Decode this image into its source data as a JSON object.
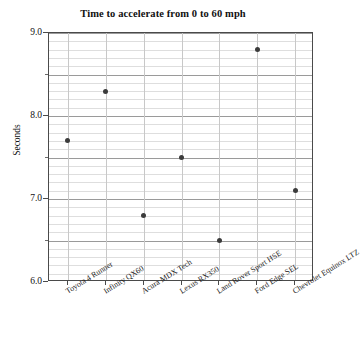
{
  "chart_data": {
    "type": "scatter",
    "title": "Time to accelerate from 0 to 60 mph",
    "xlabel": "",
    "ylabel": "Seconds",
    "categories": [
      "Toyota 4 Runner",
      "Infinity QX60",
      "Acura MDX Tech",
      "Lexus RX350",
      "Land Rover Sport HSE",
      "Ford Edge SEL",
      "Chevrolet Equinox LTZ"
    ],
    "values": [
      7.7,
      8.3,
      6.8,
      7.5,
      6.5,
      8.8,
      7.1
    ],
    "ylim": [
      6.0,
      9.0
    ],
    "y_major_ticks": [
      "9.0",
      "8.0",
      "7.0",
      "6.0"
    ],
    "y_major_values": [
      9.0,
      8.0,
      7.0,
      6.0
    ],
    "y_minor_step": 0.1,
    "y_midtick_values": [
      8.5,
      7.5,
      6.5
    ],
    "grid": true,
    "legend": "none",
    "marker_color": "#3b3b3b",
    "axis_color": "#4a4a4a",
    "gridline_minor_color": "#dedede",
    "gridline_major_color": "#9a9a9a",
    "gridline_vertical_color": "#c8c8c8",
    "background_color": "#ffffff"
  }
}
